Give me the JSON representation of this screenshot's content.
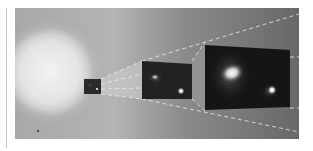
{
  "figure": {
    "colors": {
      "background_left": "#a4a4a4",
      "background_right": "#6a6a6a",
      "halo": "#e6e6e6",
      "panel_dark": "#151515",
      "guide_lines": "#e8e8e8"
    },
    "panels": [
      {
        "name": "source-sphere",
        "cx": 50,
        "cy": 72,
        "r": 42
      },
      {
        "name": "zoom-panel-1",
        "x": 84,
        "y": 79,
        "w": 17,
        "h": 15
      },
      {
        "name": "zoom-panel-2",
        "x": 142,
        "y": 61,
        "w": 50,
        "h": 38
      },
      {
        "name": "zoom-panel-3",
        "x": 205,
        "y": 42,
        "w": 85,
        "h": 69
      }
    ]
  }
}
